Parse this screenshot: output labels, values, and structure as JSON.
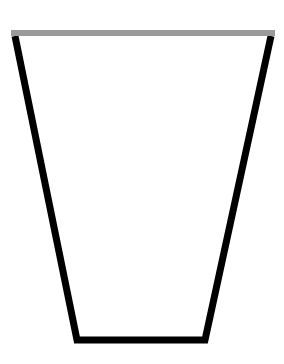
{
  "diagram": {
    "shape": "trapezoid-cup",
    "background": "#ffffff",
    "rim": {
      "color": "#9a9a9a",
      "x1": 11,
      "x2": 275,
      "y": 33,
      "thickness": 6
    },
    "outline": {
      "color": "#000000",
      "stroke_width": 7,
      "points": [
        [
          15,
          36
        ],
        [
          271,
          36
        ],
        [
          205,
          340
        ],
        [
          77,
          340
        ]
      ]
    }
  }
}
